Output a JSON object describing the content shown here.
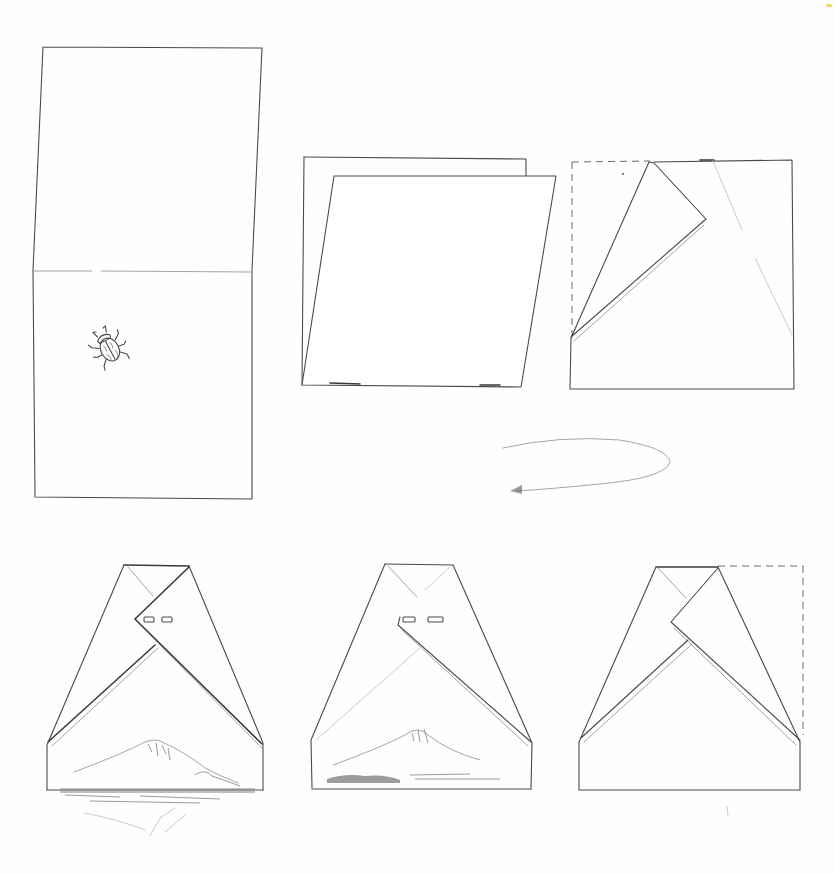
{
  "diagram": {
    "type": "origami-folding-instructions",
    "style": "pencil-sketch",
    "colors": {
      "background": "#fefefe",
      "line": "#4a4a4a",
      "line_light": "#9a9a9a",
      "corner_mark": "#f3d36a"
    },
    "steps": [
      {
        "id": "step-1",
        "label": "",
        "description": "Tall rectangle sheet with horizontal center crease; small beetle drawn in lower half"
      },
      {
        "id": "step-2",
        "label": "",
        "description": "Square sheet with a second skewed sheet (parallelogram) overlaid"
      },
      {
        "id": "step-3",
        "label": "",
        "description": "Square with dashed left/top edges; upper-left flap folded diagonally"
      },
      {
        "id": "turn-over-arrow",
        "label": "",
        "description": "Curved looping arrow indicating turn over"
      },
      {
        "id": "step-4",
        "label": "",
        "description": "Finished kimono-like shape with two eye slots and Mt. Fuji landscape with reflection"
      },
      {
        "id": "step-5",
        "label": "",
        "description": "Finished shape with two eye slots and Mt. Fuji landscape"
      },
      {
        "id": "step-6",
        "label": "",
        "description": "Folded shape with dashed outline at upper right"
      }
    ],
    "icons": {
      "beetle": "beetle-icon",
      "mountain": "mount-fuji-illustration",
      "arrow": "turn-over-arrow-icon"
    }
  }
}
